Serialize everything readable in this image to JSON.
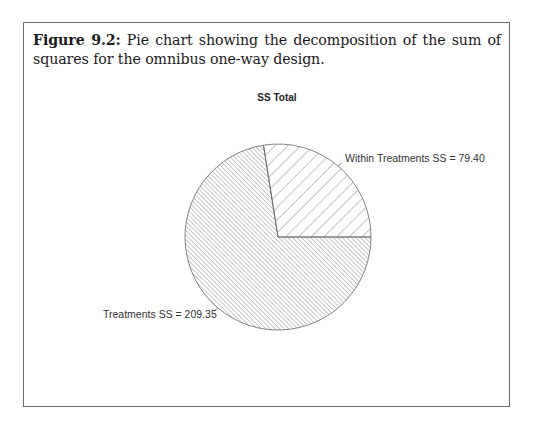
{
  "figure": {
    "label": "Figure 9.2:",
    "caption": "Pie chart showing the decomposition of the sum of squares for the omnibus one-way design."
  },
  "chart_data": {
    "type": "pie",
    "title": "SS Total",
    "categories": [
      "Within Treatments SS",
      "Treatments SS"
    ],
    "values": [
      79.4,
      209.35
    ],
    "labels": [
      "Within Treatments SS = 79.40",
      "Treatments SS = 209.35"
    ],
    "fills": [
      "hatch-wide-45deg",
      "hatch-dense-135deg"
    ],
    "start_angle_deg": 0,
    "direction": "counterclockwise",
    "total": 288.75,
    "colors": {
      "stroke": "#666666",
      "background": "#ffffff"
    }
  }
}
